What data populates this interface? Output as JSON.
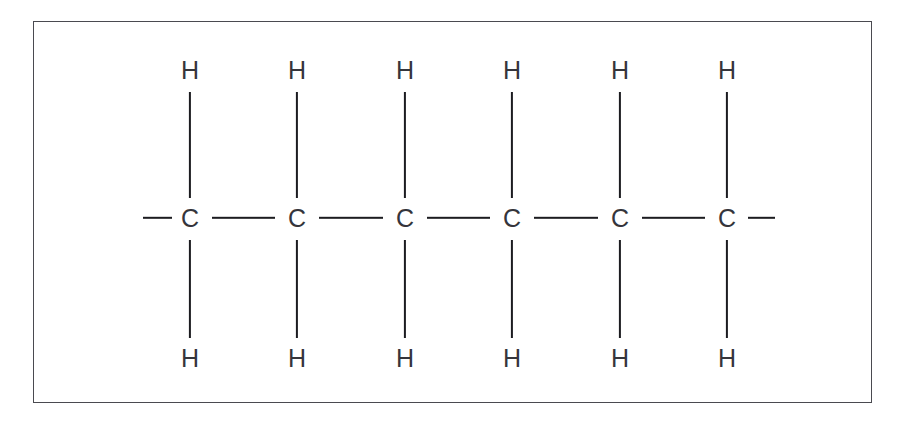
{
  "diagram": {
    "type": "chemical-structural-formula",
    "background_color": "#ffffff",
    "bond_color": "#1c1c20",
    "atom_color": "#35353b",
    "frame_color": "#4a4a50",
    "frame": {
      "x": 33,
      "y": 21,
      "width": 839,
      "height": 382
    },
    "chain": {
      "backbone_y": 218,
      "top_label_y": 70,
      "bottom_label_y": 358,
      "carbon_spacing": 107,
      "carbon_count": 6,
      "hydrogen_count": 12
    },
    "carbons": [
      {
        "label": "C",
        "x": 190
      },
      {
        "label": "C",
        "x": 297
      },
      {
        "label": "C",
        "x": 405
      },
      {
        "label": "C",
        "x": 512
      },
      {
        "label": "C",
        "x": 620
      },
      {
        "label": "C",
        "x": 727
      }
    ],
    "hydrogens_top": [
      {
        "label": "H",
        "x": 190
      },
      {
        "label": "H",
        "x": 297
      },
      {
        "label": "H",
        "x": 405
      },
      {
        "label": "H",
        "x": 512
      },
      {
        "label": "H",
        "x": 620
      },
      {
        "label": "H",
        "x": 727
      }
    ],
    "hydrogens_bottom": [
      {
        "label": "H",
        "x": 190
      },
      {
        "label": "H",
        "x": 297
      },
      {
        "label": "H",
        "x": 405
      },
      {
        "label": "H",
        "x": 512
      },
      {
        "label": "H",
        "x": 620
      },
      {
        "label": "H",
        "x": 727
      }
    ],
    "bonds_vertical_top": [
      {
        "x": 190,
        "y1": 92,
        "y2": 198
      },
      {
        "x": 297,
        "y1": 92,
        "y2": 198
      },
      {
        "x": 405,
        "y1": 92,
        "y2": 198
      },
      {
        "x": 512,
        "y1": 92,
        "y2": 198
      },
      {
        "x": 620,
        "y1": 92,
        "y2": 198
      },
      {
        "x": 727,
        "y1": 92,
        "y2": 198
      }
    ],
    "bonds_vertical_bottom": [
      {
        "x": 190,
        "y1": 240,
        "y2": 338
      },
      {
        "x": 297,
        "y1": 240,
        "y2": 338
      },
      {
        "x": 405,
        "y1": 240,
        "y2": 338
      },
      {
        "x": 512,
        "y1": 240,
        "y2": 338
      },
      {
        "x": 620,
        "y1": 240,
        "y2": 338
      },
      {
        "x": 727,
        "y1": 240,
        "y2": 338
      }
    ],
    "bonds_horizontal": [
      {
        "x1": 212,
        "x2": 275,
        "y": 218
      },
      {
        "x1": 319,
        "x2": 383,
        "y": 218
      },
      {
        "x1": 427,
        "x2": 490,
        "y": 218
      },
      {
        "x1": 534,
        "x2": 598,
        "y": 218
      },
      {
        "x1": 642,
        "x2": 705,
        "y": 218
      }
    ],
    "bond_stubs": [
      {
        "name": "left-continuation-bond",
        "x1": 143,
        "x2": 172,
        "y": 218
      },
      {
        "name": "right-continuation-bond",
        "x1": 748,
        "x2": 775,
        "y": 218
      }
    ]
  }
}
